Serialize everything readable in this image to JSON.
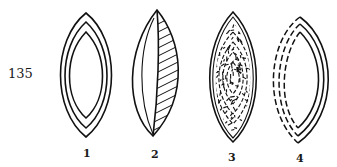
{
  "plate": {
    "number": "135"
  },
  "figures": [
    {
      "id": "1",
      "label": "1",
      "description": "lens shape with three concentric solid outlines"
    },
    {
      "id": "2",
      "label": "2",
      "description": "lens shape split vertically, left plain with inner arc, right hatched"
    },
    {
      "id": "3",
      "label": "3",
      "description": "lens shape with nested outlines densely filled with short strokes"
    },
    {
      "id": "4",
      "label": "4",
      "description": "lens shape with three outlines, solid on right and dashed on left"
    }
  ],
  "colors": {
    "ink": "#111111",
    "paper": "#ffffff"
  }
}
